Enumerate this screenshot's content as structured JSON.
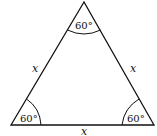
{
  "figure": {
    "type": "equilateral-triangle",
    "angles": {
      "top": "60°",
      "bottom_left": "60°",
      "bottom_right": "60°"
    },
    "sides": {
      "left": "x",
      "right": "x",
      "bottom": "x"
    },
    "colors": {
      "stroke": "#111111",
      "background": "#ffffff"
    }
  }
}
